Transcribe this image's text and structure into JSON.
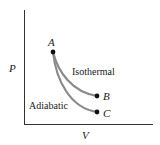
{
  "diagram": {
    "type": "PV diagram",
    "axes": {
      "y_label": "P",
      "x_label": "V"
    },
    "points": [
      {
        "id": "A",
        "label": "A"
      },
      {
        "id": "B",
        "label": "B"
      },
      {
        "id": "C",
        "label": "C"
      }
    ],
    "curves": [
      {
        "name": "isothermal",
        "label": "Isothermal",
        "from": "A",
        "to": "B"
      },
      {
        "name": "adiabatic",
        "label": "Adiabatic",
        "from": "A",
        "to": "C"
      }
    ],
    "colors": {
      "axis": "#333333",
      "curve": "#8a8a8a",
      "point": "#111111",
      "text": "#1a1a1a"
    }
  }
}
